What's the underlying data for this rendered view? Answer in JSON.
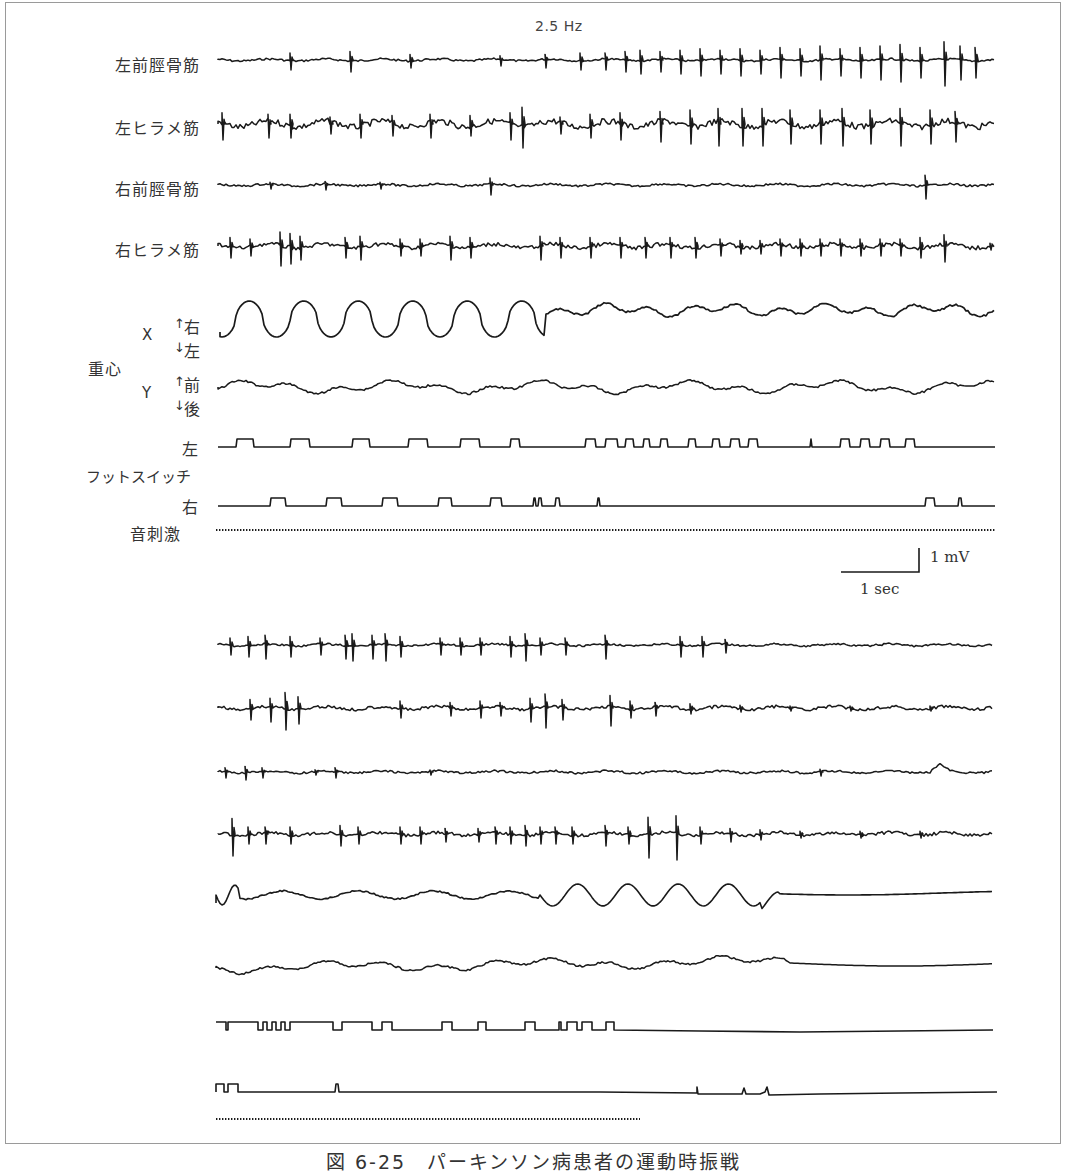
{
  "figure": {
    "frequency_label": "2.5 Hz",
    "caption": "図 6-25　パーキンソン病患者の運動時振戦",
    "scale_bar": {
      "voltage": "1 mV",
      "time": "1 sec"
    },
    "colors": {
      "trace": "#1a1a1a",
      "frame": "#9a9a9a",
      "text": "#333333"
    }
  },
  "labels": {
    "left_tibialis_anterior": "左前脛骨筋",
    "left_soleus": "左ヒラメ筋",
    "right_tibialis_anterior": "右前脛骨筋",
    "right_soleus": "右ヒラメ筋",
    "center_of_gravity": "重心",
    "x_axis": "X",
    "x_up": "右",
    "x_down": "左",
    "y_axis": "Y",
    "y_up": "前",
    "y_down": "後",
    "footswitch": "フットスイッチ",
    "footswitch_left": "左",
    "footswitch_right": "右",
    "sound_stimulus": "音刺激"
  },
  "chart_data": [
    {
      "type": "line",
      "title": "Upper panel (tremor period)",
      "x_range_px": [
        218,
        995
      ],
      "series": [
        {
          "name": "左前脛骨筋",
          "kind": "emg",
          "baseline": 60,
          "noise": 2,
          "spikes": [
            [
              290,
              10
            ],
            [
              350,
              12
            ],
            [
              410,
              8
            ],
            [
              500,
              6
            ],
            [
              545,
              8
            ],
            [
              580,
              10
            ],
            [
              605,
              10
            ],
            [
              625,
              12
            ],
            [
              640,
              14
            ],
            [
              660,
              12
            ],
            [
              680,
              14
            ],
            [
              700,
              16
            ],
            [
              720,
              14
            ],
            [
              740,
              16
            ],
            [
              760,
              14
            ],
            [
              780,
              18
            ],
            [
              800,
              16
            ],
            [
              820,
              20
            ],
            [
              840,
              16
            ],
            [
              860,
              18
            ],
            [
              880,
              20
            ],
            [
              900,
              22
            ],
            [
              920,
              18
            ],
            [
              944,
              26
            ],
            [
              960,
              20
            ],
            [
              975,
              18
            ]
          ]
        },
        {
          "name": "左ヒラメ筋",
          "kind": "emg",
          "baseline": 124,
          "noise": 6,
          "spikes": [
            [
              222,
              16
            ],
            [
              268,
              14
            ],
            [
              290,
              14
            ],
            [
              330,
              10
            ],
            [
              360,
              14
            ],
            [
              392,
              12
            ],
            [
              430,
              14
            ],
            [
              470,
              12
            ],
            [
              510,
              16
            ],
            [
              522,
              24
            ],
            [
              560,
              10
            ],
            [
              590,
              14
            ],
            [
              620,
              16
            ],
            [
              660,
              18
            ],
            [
              690,
              20
            ],
            [
              718,
              22
            ],
            [
              742,
              22
            ],
            [
              762,
              22
            ],
            [
              790,
              20
            ],
            [
              820,
              20
            ],
            [
              842,
              22
            ],
            [
              870,
              20
            ],
            [
              900,
              22
            ],
            [
              930,
              20
            ],
            [
              955,
              18
            ],
            [
              995,
              14
            ]
          ]
        },
        {
          "name": "右前脛骨筋",
          "kind": "emg",
          "baseline": 185,
          "noise": 2,
          "spikes": [
            [
              270,
              4
            ],
            [
              325,
              5
            ],
            [
              380,
              4
            ],
            [
              490,
              10
            ],
            [
              925,
              14
            ]
          ]
        },
        {
          "name": "右ヒラメ筋",
          "kind": "emg",
          "baseline": 246,
          "noise": 4,
          "spikes": [
            [
              230,
              12
            ],
            [
              250,
              10
            ],
            [
              280,
              20
            ],
            [
              290,
              18
            ],
            [
              300,
              14
            ],
            [
              345,
              12
            ],
            [
              360,
              14
            ],
            [
              400,
              10
            ],
            [
              420,
              10
            ],
            [
              450,
              14
            ],
            [
              470,
              12
            ],
            [
              540,
              14
            ],
            [
              560,
              12
            ],
            [
              590,
              12
            ],
            [
              620,
              12
            ],
            [
              645,
              12
            ],
            [
              670,
              12
            ],
            [
              695,
              12
            ],
            [
              720,
              10
            ],
            [
              740,
              8
            ],
            [
              760,
              8
            ],
            [
              780,
              10
            ],
            [
              800,
              10
            ],
            [
              820,
              10
            ],
            [
              840,
              10
            ],
            [
              860,
              10
            ],
            [
              880,
              10
            ],
            [
              900,
              10
            ],
            [
              920,
              12
            ],
            [
              944,
              16
            ],
            [
              990,
              4
            ]
          ]
        },
        {
          "name": "重心 X",
          "kind": "cog_x",
          "baseline": 318,
          "description": "large sinusoidal oscillation ~6 cycles then small irregular waves"
        },
        {
          "name": "重心 Y",
          "kind": "cog_y",
          "baseline": 387
        },
        {
          "name": "フットスイッチ 左",
          "kind": "footswitch",
          "baseline": 447,
          "height": 8,
          "pulses": [
            [
              236,
              254
            ],
            [
              290,
              310
            ],
            [
              352,
              370
            ],
            [
              408,
              428
            ],
            [
              460,
              480
            ],
            [
              510,
              520
            ],
            [
              585,
              596
            ],
            [
              605,
              618
            ],
            [
              625,
              634
            ],
            [
              643,
              650
            ],
            [
              660,
              668
            ],
            [
              688,
              696
            ],
            [
              712,
              720
            ],
            [
              730,
              740
            ],
            [
              748,
              758
            ],
            [
              810,
              812
            ],
            [
              840,
              850
            ],
            [
              860,
              870
            ],
            [
              880,
              890
            ],
            [
              905,
              915
            ]
          ]
        },
        {
          "name": "フットスイッチ 右",
          "kind": "footswitch",
          "baseline": 506,
          "height": 8,
          "pulses": [
            [
              270,
              286
            ],
            [
              326,
              342
            ],
            [
              382,
              398
            ],
            [
              438,
              452
            ],
            [
              490,
              502
            ],
            [
              533,
              536
            ],
            [
              538,
              542
            ],
            [
              555,
              560
            ],
            [
              597,
              600
            ],
            [
              925,
              935
            ],
            [
              958,
              962
            ]
          ]
        },
        {
          "name": "音刺激",
          "kind": "dots",
          "baseline": 530,
          "x_end": 995
        }
      ]
    },
    {
      "type": "line",
      "title": "Lower panel (tremor cessation)",
      "x_range_px": [
        218,
        993
      ],
      "series": [
        {
          "name": "左前脛骨筋",
          "kind": "emg",
          "baseline": 645,
          "noise": 2,
          "spikes": [
            [
              230,
              10
            ],
            [
              248,
              12
            ],
            [
              265,
              14
            ],
            [
              290,
              12
            ],
            [
              320,
              10
            ],
            [
              345,
              14
            ],
            [
              352,
              16
            ],
            [
              372,
              14
            ],
            [
              385,
              16
            ],
            [
              400,
              12
            ],
            [
              440,
              10
            ],
            [
              460,
              10
            ],
            [
              480,
              10
            ],
            [
              510,
              12
            ],
            [
              525,
              16
            ],
            [
              540,
              10
            ],
            [
              565,
              10
            ],
            [
              605,
              14
            ],
            [
              680,
              12
            ],
            [
              702,
              12
            ],
            [
              725,
              8
            ]
          ]
        },
        {
          "name": "左ヒラメ筋",
          "kind": "emg",
          "baseline": 708,
          "noise": 3,
          "spikes": [
            [
              250,
              12
            ],
            [
              270,
              14
            ],
            [
              285,
              22
            ],
            [
              298,
              16
            ],
            [
              400,
              10
            ],
            [
              450,
              8
            ],
            [
              480,
              10
            ],
            [
              500,
              8
            ],
            [
              530,
              14
            ],
            [
              545,
              20
            ],
            [
              562,
              12
            ],
            [
              610,
              18
            ],
            [
              630,
              10
            ],
            [
              655,
              8
            ],
            [
              690,
              6
            ],
            [
              740,
              4
            ],
            [
              790,
              3
            ],
            [
              850,
              3
            ],
            [
              930,
              3
            ]
          ]
        },
        {
          "name": "右前脛骨筋",
          "kind": "emg",
          "baseline": 772,
          "noise": 2,
          "spikes": [
            [
              225,
              6
            ],
            [
              245,
              8
            ],
            [
              262,
              6
            ],
            [
              315,
              3
            ],
            [
              335,
              6
            ],
            [
              430,
              3
            ],
            [
              820,
              4
            ]
          ],
          "bump": [
            940,
            -8
          ]
        },
        {
          "name": "右ヒラメ筋",
          "kind": "emg",
          "baseline": 834,
          "noise": 3,
          "spikes": [
            [
              232,
              22
            ],
            [
              248,
              10
            ],
            [
              265,
              10
            ],
            [
              290,
              10
            ],
            [
              340,
              12
            ],
            [
              358,
              10
            ],
            [
              400,
              10
            ],
            [
              420,
              10
            ],
            [
              445,
              8
            ],
            [
              478,
              8
            ],
            [
              495,
              10
            ],
            [
              510,
              10
            ],
            [
              525,
              12
            ],
            [
              540,
              10
            ],
            [
              555,
              10
            ],
            [
              572,
              10
            ],
            [
              605,
              12
            ],
            [
              628,
              10
            ],
            [
              648,
              24
            ],
            [
              676,
              26
            ],
            [
              700,
              10
            ],
            [
              730,
              8
            ],
            [
              760,
              6
            ],
            [
              800,
              4
            ],
            [
              860,
              4
            ],
            [
              920,
              4
            ]
          ]
        },
        {
          "name": "重心 X",
          "kind": "cog_x2",
          "baseline": 895
        },
        {
          "name": "重心 Y",
          "kind": "cog_y2",
          "baseline": 968
        },
        {
          "name": "フットスイッチ 左",
          "kind": "footswitch_inv",
          "baseline": 1030,
          "height": 8
        },
        {
          "name": "フットスイッチ 右",
          "kind": "footswitch2",
          "baseline": 1092
        },
        {
          "name": "音刺激",
          "kind": "dots",
          "baseline": 1119,
          "x_end": 640
        }
      ]
    }
  ]
}
